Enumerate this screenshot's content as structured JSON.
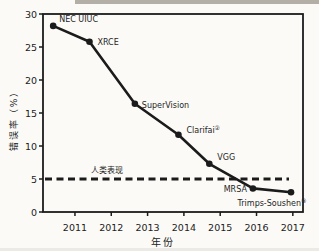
{
  "colors": {
    "ink": "#1b1b1b",
    "background": "#fbfaf7",
    "artifact_grey": "#9b958b"
  },
  "chart_data": {
    "type": "line",
    "title": "",
    "xlabel": "年份",
    "ylabel": "错误率（%）",
    "xlim": [
      2010.12,
      2017.28
    ],
    "ylim": [
      0,
      30
    ],
    "grid": false,
    "legend": "none",
    "x_ticks": [
      2011,
      2012,
      2013,
      2014,
      2015,
      2016,
      2017
    ],
    "y_ticks": [
      0,
      5,
      10,
      15,
      20,
      25,
      30
    ],
    "series": [
      {
        "points": [
          {
            "label": "NEC UIUC",
            "sup": "",
            "x": 2010.4,
            "y": 28.2,
            "label_dx": 6,
            "label_dy": -4,
            "anchor": "start"
          },
          {
            "label": "XRCE",
            "sup": "",
            "x": 2011.4,
            "y": 25.8,
            "label_dx": 8,
            "label_dy": 3,
            "anchor": "start"
          },
          {
            "label": "SuperVision",
            "sup": "",
            "x": 2012.65,
            "y": 16.4,
            "label_dx": 7,
            "label_dy": 4,
            "anchor": "start"
          },
          {
            "label": "Clarifai",
            "sup": "②",
            "x": 2013.85,
            "y": 11.7,
            "label_dx": 8,
            "label_dy": -2,
            "anchor": "start"
          },
          {
            "label": "VGG",
            "sup": "",
            "x": 2014.7,
            "y": 7.3,
            "label_dx": 8,
            "label_dy": -4,
            "anchor": "start"
          },
          {
            "label": "MRSA",
            "sup": "",
            "x": 2015.9,
            "y": 3.57,
            "label_dx": -6,
            "label_dy": 4,
            "anchor": "end"
          },
          {
            "label": "Trimps-Soushen",
            "sup": "③",
            "x": 2016.95,
            "y": 2.99,
            "label_dx": -19,
            "label_dy": 14,
            "anchor": "middle"
          }
        ]
      }
    ],
    "reference_line": {
      "label": "人类表现",
      "y": 5,
      "style": "dashed"
    }
  }
}
